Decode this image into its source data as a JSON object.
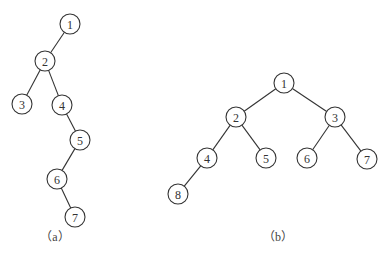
{
  "diagram": {
    "type": "binary-trees",
    "colors": {
      "stroke": "#333333",
      "background": "#ffffff"
    },
    "node_radius": 10,
    "trees": [
      {
        "id": "a",
        "caption": "（a）",
        "caption_pos": [
          55,
          241
        ],
        "nodes": [
          {
            "label": "1",
            "x": 70,
            "y": 24
          },
          {
            "label": "2",
            "x": 45,
            "y": 61
          },
          {
            "label": "3",
            "x": 22,
            "y": 104
          },
          {
            "label": "4",
            "x": 62,
            "y": 105
          },
          {
            "label": "5",
            "x": 80,
            "y": 140
          },
          {
            "label": "6",
            "x": 57,
            "y": 179
          },
          {
            "label": "7",
            "x": 75,
            "y": 217
          }
        ],
        "edges": [
          [
            "1",
            "2"
          ],
          [
            "2",
            "3"
          ],
          [
            "2",
            "4"
          ],
          [
            "4",
            "5"
          ],
          [
            "5",
            "6"
          ],
          [
            "6",
            "7"
          ]
        ]
      },
      {
        "id": "b",
        "caption": "（b）",
        "caption_pos": [
          278,
          241
        ],
        "nodes": [
          {
            "label": "1",
            "x": 284,
            "y": 83
          },
          {
            "label": "2",
            "x": 236,
            "y": 117
          },
          {
            "label": "3",
            "x": 335,
            "y": 117
          },
          {
            "label": "4",
            "x": 207,
            "y": 158
          },
          {
            "label": "5",
            "x": 266,
            "y": 158
          },
          {
            "label": "6",
            "x": 307,
            "y": 158
          },
          {
            "label": "7",
            "x": 367,
            "y": 159
          },
          {
            "label": "8",
            "x": 178,
            "y": 194
          }
        ],
        "edges": [
          [
            "1",
            "2"
          ],
          [
            "1",
            "3"
          ],
          [
            "2",
            "4"
          ],
          [
            "2",
            "5"
          ],
          [
            "3",
            "6"
          ],
          [
            "3",
            "7"
          ],
          [
            "4",
            "8"
          ]
        ]
      }
    ]
  }
}
